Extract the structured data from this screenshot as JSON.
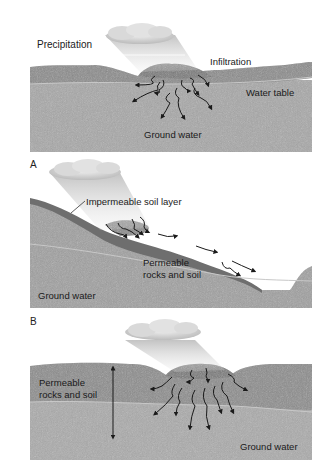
{
  "figure": {
    "panels": [
      {
        "id": "top",
        "letter": "",
        "labels": {
          "precipitation": "Precipitation",
          "infiltration": "Infiltration",
          "water_table": "Water table",
          "ground_water": "Ground water"
        }
      },
      {
        "id": "A",
        "letter": "A",
        "labels": {
          "impermeable": "Impermeable soil layer",
          "permeable_1": "Permeable",
          "permeable_2": "rocks and soil",
          "ground_water": "Ground water"
        }
      },
      {
        "id": "B",
        "letter": "B",
        "labels": {
          "permeable_1": "Permeable",
          "permeable_2": "rocks and soil",
          "ground_water": "Ground water"
        }
      }
    ],
    "colors": {
      "topsoil": "#8a8a8a",
      "subsoil": "#9d9d9d",
      "saturated": "#a9a9a9",
      "water_table_line": "#c4c4c4",
      "impermeable": "#6f6f6f",
      "cloud": "#d8d8d8",
      "arrow": "#1a1a1a"
    }
  }
}
